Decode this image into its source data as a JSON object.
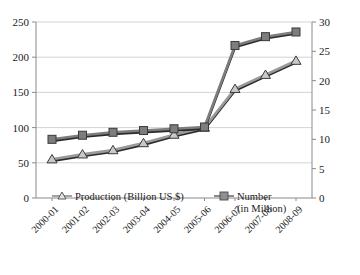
{
  "chart_data": {
    "type": "line",
    "title": "",
    "subtitle": "",
    "xlabel": "",
    "ylabel": "",
    "grid": true,
    "legend_position": "inside-bottom",
    "categories": [
      "2000-01",
      "2001-02",
      "2002-03",
      "2003-04",
      "2004-05",
      "2005-06",
      "2006-07",
      "2007-08",
      "2008-09"
    ],
    "axes": {
      "left": {
        "label": "Production (Billion US $)",
        "min": 0,
        "max": 250,
        "ticks": [
          0,
          50,
          100,
          150,
          200,
          250
        ],
        "tick_labels": [
          "0",
          "50",
          "100",
          "150",
          "200",
          "250"
        ]
      },
      "right": {
        "label": "Number (in Million)",
        "min": 0,
        "max": 30,
        "ticks": [
          0,
          5,
          10,
          15,
          20,
          25,
          30
        ],
        "tick_labels": [
          "0",
          "5",
          "10",
          "15",
          "20",
          "25",
          "30"
        ]
      }
    },
    "series": [
      {
        "name": "Production (Billion US $)",
        "axis": "left",
        "marker": "triangle",
        "color": "#9a9a9a",
        "line_color": "#2b2b2b",
        "values": [
          55,
          62,
          68,
          78,
          90,
          100,
          155,
          175,
          195
        ]
      },
      {
        "name": "Number (in Million)",
        "axis": "right",
        "marker": "square",
        "color": "#7d7d7d",
        "line_color": "#2b2b2b",
        "values": [
          10,
          10.7,
          11.2,
          11.5,
          11.8,
          12.1,
          26,
          27.5,
          28.3
        ]
      }
    ]
  },
  "legend": {
    "items": [
      {
        "label": "Production (Billion US $)",
        "marker": "triangle"
      },
      {
        "label": "Number",
        "label2": "(in Million)",
        "marker": "square"
      }
    ]
  },
  "colors": {
    "grid": "#c8c8c8",
    "axis": "#8a8a8a",
    "line_dark": "#2b2b2b",
    "marker_light": "#9a9a9a",
    "marker_dark": "#7d7d7d",
    "text": "#1a1a1a",
    "background": "#ffffff"
  }
}
